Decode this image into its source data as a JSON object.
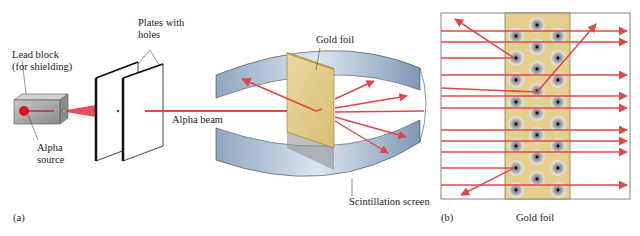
{
  "figure": {
    "panel_a": {
      "caption": "(a)",
      "labels": {
        "lead_block_line1": "Lead block",
        "lead_block_line2": "(for shielding)",
        "plates_line1": "Plates with",
        "plates_line2": "holes",
        "alpha_source_line1": "Alpha",
        "alpha_source_line2": "source",
        "alpha_beam": "Alpha beam",
        "gold_foil": "Gold foil",
        "scintillation_screen": "Scintillation screen"
      }
    },
    "panel_b": {
      "caption": "(b)",
      "foil_label": "Gold foil"
    },
    "colors": {
      "beam": "#e04848",
      "foil": "#e6cf8e",
      "screen": "#9fb4cc",
      "lead": "#9a9a9a",
      "source": "#e01020"
    }
  }
}
